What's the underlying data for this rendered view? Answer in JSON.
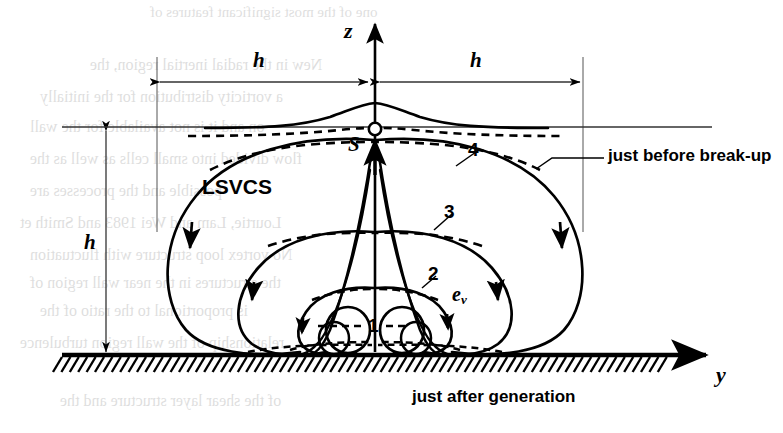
{
  "figure": {
    "structure_name": "LSVCS",
    "axes": {
      "vertical_label": "z",
      "horizontal_label": "y"
    },
    "point_labels": {
      "saddle": "S",
      "vortex_velocity": "e",
      "vortex_velocity_sub": "v"
    },
    "dimensions": [
      {
        "id": "h-left",
        "label": "h",
        "orientation": "horizontal"
      },
      {
        "id": "h-right",
        "label": "h",
        "orientation": "horizontal"
      },
      {
        "id": "h-height",
        "label": "h",
        "orientation": "vertical"
      }
    ],
    "loop_labels": [
      "1",
      "2",
      "3",
      "4"
    ],
    "annotations": [
      {
        "id": "top",
        "text": "just before break-up"
      },
      {
        "id": "bottom",
        "text": "just after generation"
      }
    ],
    "colors": {
      "ink": "#000000",
      "background": "#ffffff",
      "thin_rule": "#555555"
    },
    "ghost_text": [
      {
        "text": "one of the most significant features of",
        "x": 150,
        "y": 4,
        "size": 15
      },
      {
        "text": "New in the radial inertial region, the",
        "x": 90,
        "y": 56,
        "size": 16
      },
      {
        "text": "a vorticity distribution for the initially",
        "x": 40,
        "y": 88,
        "size": 16
      },
      {
        "text": "on and it is not available for the wall",
        "x": 30,
        "y": 118,
        "size": 16
      },
      {
        "text": "flow divided into small cells as well as the",
        "x": 30,
        "y": 150,
        "size": 16
      },
      {
        "text": "possible and the processes are",
        "x": 30,
        "y": 182,
        "size": 16
      },
      {
        "text": "Lourtie, Lam and Wei 1983 and Smith et",
        "x": 20,
        "y": 214,
        "size": 16
      },
      {
        "text": "No vortex loop structure with fluctuation",
        "x": 30,
        "y": 246,
        "size": 16
      },
      {
        "text": "the structures in the near wall region of",
        "x": 30,
        "y": 274,
        "size": 16
      },
      {
        "text": "is proportional to the ratio of the",
        "x": 40,
        "y": 302,
        "size": 16
      },
      {
        "text": "relationship of the wall region turbulence",
        "x": 20,
        "y": 334,
        "size": 16
      },
      {
        "text": "of the shear layer structure and the",
        "x": 60,
        "y": 392,
        "size": 16
      }
    ]
  }
}
